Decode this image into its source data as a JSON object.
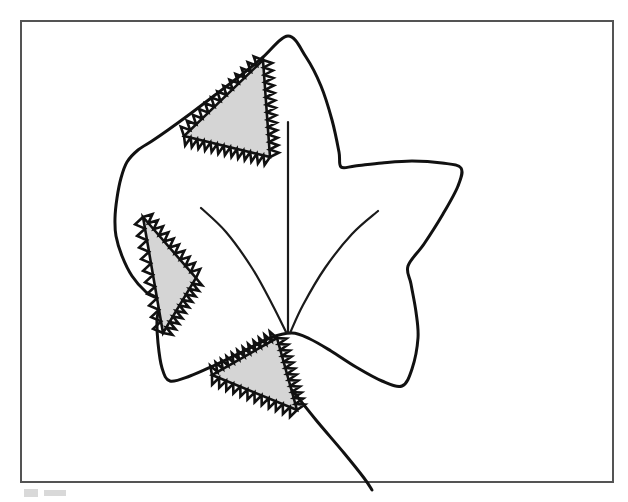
{
  "figure": {
    "background_color": "#ffffff",
    "frame": {
      "name": "border-frame",
      "x": 21,
      "y": 21,
      "width": 592,
      "height": 461,
      "stroke_color": "#545454",
      "stroke_width": 2
    },
    "leaf": {
      "name": "maple-leaf-outline",
      "stroke_color": "#111111",
      "stroke_width": 3,
      "fill": "none",
      "apex": [
        288,
        36
      ],
      "outline_points": [
        [
          288,
          36
        ],
        [
          306,
          57
        ],
        [
          321,
          86
        ],
        [
          332,
          120
        ],
        [
          339,
          152
        ],
        [
          341,
          167
        ],
        [
          355,
          166
        ],
        [
          382,
          163
        ],
        [
          412,
          161
        ],
        [
          442,
          163
        ],
        [
          461,
          168
        ],
        [
          458,
          186
        ],
        [
          443,
          214
        ],
        [
          424,
          244
        ],
        [
          408,
          266
        ],
        [
          411,
          284
        ],
        [
          416,
          312
        ],
        [
          418,
          338
        ],
        [
          412,
          369
        ],
        [
          402,
          386
        ],
        [
          382,
          381
        ],
        [
          356,
          367
        ],
        [
          331,
          351
        ],
        [
          310,
          339
        ],
        [
          292,
          333
        ],
        [
          270,
          338
        ],
        [
          242,
          352
        ],
        [
          213,
          366
        ],
        [
          190,
          376
        ],
        [
          170,
          381
        ],
        [
          162,
          368
        ],
        [
          158,
          343
        ],
        [
          157,
          320
        ],
        [
          159,
          300
        ],
        [
          146,
          292
        ],
        [
          132,
          276
        ],
        [
          122,
          256
        ],
        [
          116,
          236
        ],
        [
          115,
          218
        ],
        [
          117,
          198
        ],
        [
          121,
          178
        ],
        [
          127,
          162
        ],
        [
          138,
          150
        ],
        [
          152,
          141
        ],
        [
          168,
          130
        ],
        [
          190,
          114
        ],
        [
          215,
          95
        ],
        [
          240,
          76
        ],
        [
          262,
          58
        ]
      ],
      "stem": {
        "name": "leaf-stem",
        "points": [
          [
            292,
            390
          ],
          [
            316,
            420
          ],
          [
            344,
            453
          ],
          [
            364,
            478
          ],
          [
            372,
            490
          ]
        ]
      },
      "veins": [
        {
          "name": "midrib-vein",
          "points": [
            [
              288,
              122
            ],
            [
              288,
              200
            ],
            [
              288,
              260
            ],
            [
              288,
              296
            ],
            [
              288,
              333
            ]
          ]
        },
        {
          "name": "left-lateral-vein",
          "points": [
            [
              201,
              208
            ],
            [
              226,
              232
            ],
            [
              252,
              268
            ],
            [
              272,
              304
            ],
            [
              286,
              332
            ]
          ]
        },
        {
          "name": "right-lateral-vein",
          "points": [
            [
              378,
              211
            ],
            [
              352,
              234
            ],
            [
              325,
              268
            ],
            [
              303,
              305
            ],
            [
              290,
              333
            ]
          ]
        }
      ]
    },
    "fractal_triangles": [
      {
        "name": "fractal-triangle-upper-left",
        "label": "Upper-left Koch-serrated triangle",
        "fill_color": "#d5d5d5",
        "stroke_color": "#111111",
        "vertices": [
          [
            263,
            60
          ],
          [
            184,
            136
          ],
          [
            270,
            157
          ]
        ],
        "teeth_per_edge": 13,
        "tooth_height": 9
      },
      {
        "name": "fractal-triangle-middle-left",
        "label": "Middle-left Koch-serrated triangle",
        "fill_color": "#d5d5d5",
        "stroke_color": "#111111",
        "vertices": [
          [
            143,
            217
          ],
          [
            196,
            278
          ],
          [
            163,
            333
          ]
        ],
        "teeth_per_edge": 10,
        "tooth_height": 9
      },
      {
        "name": "fractal-triangle-bottom",
        "label": "Bottom Koch-serrated triangle",
        "fill_color": "#d5d5d5",
        "stroke_color": "#111111",
        "vertices": [
          [
            277,
            338
          ],
          [
            212,
            375
          ],
          [
            297,
            410
          ]
        ],
        "teeth_per_edge": 12,
        "tooth_height": 9
      }
    ],
    "caption_smudges": [
      {
        "name": "caption-smudge-left",
        "x": 24,
        "y": 489,
        "width": 14,
        "height": 8
      },
      {
        "name": "caption-smudge-right",
        "x": 44,
        "y": 490,
        "width": 22,
        "height": 6
      }
    ]
  }
}
